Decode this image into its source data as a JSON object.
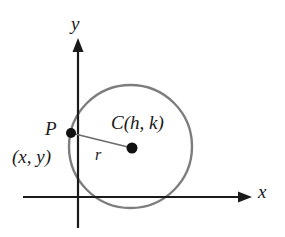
{
  "figure": {
    "background_color": "#ffffff",
    "axis_color": "#1a1a1a",
    "circle_color": "#7d7d7d",
    "radius_line_color": "#6b6b6b",
    "point_color": "#111111",
    "text_color": "#1a1a1a"
  },
  "axes": {
    "x_label": "x",
    "y_label": "y",
    "origin": {
      "x": 78,
      "y": 197
    },
    "x_axis": {
      "start_x": 23,
      "end_x": 252,
      "y": 197,
      "arrow": "right"
    },
    "y_axis": {
      "x": 78,
      "start_y": 228,
      "end_y": 38,
      "arrow": "up"
    }
  },
  "circle": {
    "center": {
      "x": 130.5,
      "y": 146.5
    },
    "radius": 61.5,
    "stroke_width": 2.4
  },
  "points": [
    {
      "name": "point-p",
      "label": "P",
      "coordinate_label": "(x, y)",
      "x": 71,
      "y": 133,
      "dot_radius": 5
    },
    {
      "name": "point-center",
      "label": "C(h, k)",
      "x": 132,
      "y": 148,
      "dot_radius": 5.5
    }
  ],
  "radius_segment": {
    "label": "r",
    "from": {
      "x": 71,
      "y": 133
    },
    "to": {
      "x": 132,
      "y": 148
    }
  },
  "labels": {
    "y_axis": "y",
    "x_axis": "x",
    "point_p": "P",
    "point_p_coords": "(x, y)",
    "radius": "r",
    "center": "C(h, k)"
  }
}
